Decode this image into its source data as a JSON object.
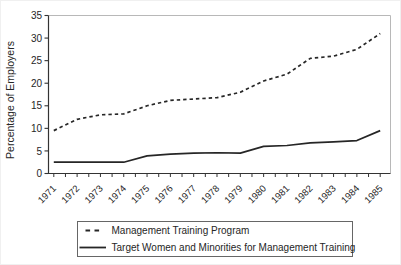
{
  "colors": {
    "background": "#ffffff",
    "axis": "#333333",
    "frame": "#b8b8b8",
    "text": "#262626",
    "line": "#262626",
    "legend_border": "#666666",
    "outer_border": "#f0f0f0"
  },
  "chart_data": {
    "type": "line",
    "title": "",
    "xlabel": "",
    "ylabel": "Percentage of Employers",
    "x_categories": [
      "1971",
      "1972",
      "1973",
      "1974",
      "1975",
      "1976",
      "1977",
      "1978",
      "1979",
      "1980",
      "1981",
      "1982",
      "1983",
      "1984",
      "1985"
    ],
    "ylim": [
      0,
      35
    ],
    "ytick_interval": 5,
    "ytick_labels": [
      "0",
      "5",
      "10",
      "15",
      "20",
      "25",
      "30",
      "35"
    ],
    "grid": false,
    "legend_position": "bottom-center-boxed",
    "series": [
      {
        "name": "Management Training Program",
        "style": "dashed",
        "color": "#262626",
        "values": [
          9.5,
          12,
          13,
          13.2,
          15,
          16.2,
          16.5,
          16.8,
          18,
          20.5,
          22,
          25.5,
          26,
          27.5,
          31
        ]
      },
      {
        "name": "Target Women and Minorities for Management Training",
        "style": "solid",
        "color": "#262626",
        "values": [
          2.5,
          2.5,
          2.5,
          2.5,
          3.9,
          4.3,
          4.5,
          4.6,
          4.5,
          6,
          6.2,
          6.8,
          7,
          7.3,
          9.5
        ]
      }
    ]
  }
}
